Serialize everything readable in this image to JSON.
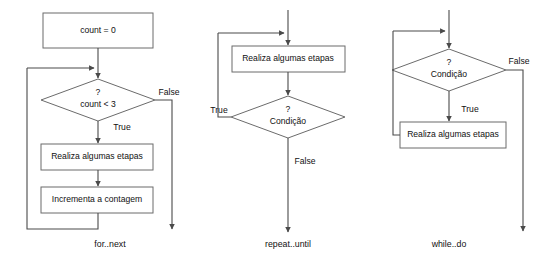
{
  "page": {
    "background_color": "#ffffff",
    "line_color": "#4a4a4a",
    "box_stroke_color": "#6b6b6b",
    "text_color": "#111111"
  },
  "flowcharts": [
    {
      "id": "for-next",
      "caption": "for..next",
      "nodes": [
        {
          "id": "init",
          "type": "process",
          "label": "count = 0"
        },
        {
          "id": "cond",
          "type": "decision",
          "marker": "?",
          "label": "count < 3"
        },
        {
          "id": "body",
          "type": "process",
          "label": "Realiza algumas etapas"
        },
        {
          "id": "incr",
          "type": "process",
          "label": "Incrementa a contagem"
        }
      ],
      "edge_labels": [
        {
          "id": "false-branch",
          "label": "False"
        },
        {
          "id": "true-branch",
          "label": "True"
        }
      ]
    },
    {
      "id": "repeat-until",
      "caption": "repeat..until",
      "nodes": [
        {
          "id": "body",
          "type": "process",
          "label": "Realiza algumas etapas"
        },
        {
          "id": "cond",
          "type": "decision",
          "marker": "?",
          "label": "Condição"
        }
      ],
      "edge_labels": [
        {
          "id": "true-branch",
          "label": "True"
        },
        {
          "id": "false-branch",
          "label": "False"
        }
      ]
    },
    {
      "id": "while-do",
      "caption": "while..do",
      "nodes": [
        {
          "id": "cond",
          "type": "decision",
          "marker": "?",
          "label": "Condição"
        },
        {
          "id": "body",
          "type": "process",
          "label": "Realiza algumas etapas"
        }
      ],
      "edge_labels": [
        {
          "id": "false-branch",
          "label": "False"
        },
        {
          "id": "true-branch",
          "label": "True"
        }
      ]
    }
  ]
}
